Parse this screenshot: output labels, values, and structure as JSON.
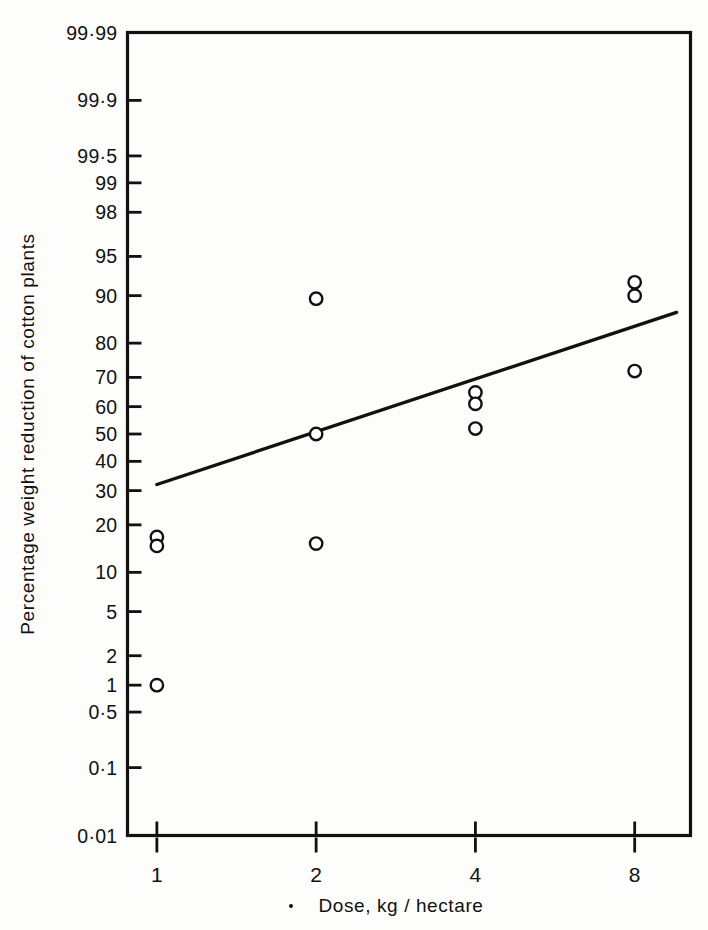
{
  "figure": {
    "background_color": "#fdfdfc",
    "ink_color": "#111111"
  },
  "chart_data": {
    "type": "scatter",
    "title": "",
    "subtitle": "",
    "xlabel": "Dose, kg / hectare",
    "ylabel": "Percentage weight reduction of cotton plants",
    "x_scale": "log2",
    "y_scale": "probit",
    "grid": false,
    "legend": null,
    "xlim": [
      0.88,
      10.2
    ],
    "ylim": [
      0.01,
      99.99
    ],
    "x_ticks": [
      1,
      2,
      4,
      8
    ],
    "x_tick_labels": [
      "1",
      "2",
      "4",
      "8"
    ],
    "y_ticks": [
      99.99,
      99.9,
      99.5,
      99,
      98,
      95,
      90,
      80,
      70,
      60,
      50,
      40,
      30,
      20,
      10,
      5,
      2,
      1,
      0.5,
      0.1,
      0.01
    ],
    "y_tick_labels": [
      "99·99",
      "99·9",
      "99·5",
      "99",
      "98",
      "95",
      "90",
      "80",
      "70",
      "60",
      "50",
      "40",
      "30",
      "20",
      "10",
      "5",
      "2",
      "1",
      "0·5",
      "0·1",
      "0·01"
    ],
    "marker": "open-circle",
    "points": [
      {
        "x": 1,
        "y": 17.0
      },
      {
        "x": 1,
        "y": 15.0
      },
      {
        "x": 1,
        "y": 1.0
      },
      {
        "x": 2,
        "y": 89.5
      },
      {
        "x": 2,
        "y": 50.0
      },
      {
        "x": 2,
        "y": 15.5
      },
      {
        "x": 4,
        "y": 65.0
      },
      {
        "x": 4,
        "y": 61.0
      },
      {
        "x": 4,
        "y": 52.0
      },
      {
        "x": 8,
        "y": 92.0
      },
      {
        "x": 8,
        "y": 90.0
      },
      {
        "x": 8,
        "y": 72.0
      }
    ],
    "fit_line": {
      "label": "",
      "x_start": 1,
      "y_start": 32.0,
      "x_end": 9.6,
      "y_end": 87.0
    }
  }
}
